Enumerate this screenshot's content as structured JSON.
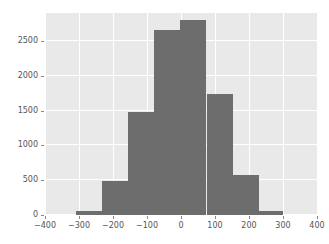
{
  "figure": {
    "background_color": "#ffffff",
    "axes_background_color": "#e9e9e9",
    "grid_color": "#ffffff",
    "bar_color": "#6d6d6d",
    "tick_color": "#555555"
  },
  "chart_data": {
    "type": "bar",
    "title": "",
    "xlabel": "",
    "ylabel": "",
    "xlim": [
      -400,
      400
    ],
    "ylim": [
      0,
      2900
    ],
    "grid": true,
    "legend": null,
    "histogram": true,
    "bin_edges": [
      -310,
      -233,
      -156,
      -79,
      -2,
      75,
      152,
      229,
      300
    ],
    "categories": [
      "-310 to -233",
      "-233 to -156",
      "-156 to -79",
      "-79 to -2",
      "-2 to 75",
      "75 to 152",
      "152 to 229",
      "229 to 300"
    ],
    "values": [
      55,
      490,
      1480,
      2660,
      2800,
      1740,
      570,
      55
    ],
    "xticks": [
      -400,
      -300,
      -200,
      -100,
      0,
      100,
      200,
      300,
      400
    ],
    "xtick_labels": [
      "−400",
      "−300",
      "−200",
      "−100",
      "0",
      "100",
      "200",
      "300",
      "400"
    ],
    "yticks": [
      0,
      500,
      1000,
      1500,
      2000,
      2500
    ],
    "ytick_labels": [
      "0",
      "500",
      "1000",
      "1500",
      "2000",
      "2500"
    ]
  }
}
